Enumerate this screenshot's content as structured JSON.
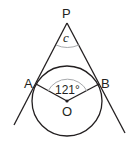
{
  "diagram": {
    "type": "geometry",
    "points": {
      "P": {
        "label": "P",
        "x": 67,
        "y": 23
      },
      "A": {
        "label": "A",
        "x": 36,
        "y": 84
      },
      "B": {
        "label": "B",
        "x": 99,
        "y": 84
      },
      "O": {
        "label": "O",
        "x": 67,
        "y": 101
      }
    },
    "circle": {
      "cx": 67,
      "cy": 101,
      "r": 35
    },
    "angles": {
      "apex": {
        "label": "c",
        "vertex": "P"
      },
      "center": {
        "label": "121°",
        "vertex": "O",
        "value_degrees": 121
      }
    },
    "colors": {
      "line": "#231f20",
      "arc": "#a7a9ac"
    }
  }
}
